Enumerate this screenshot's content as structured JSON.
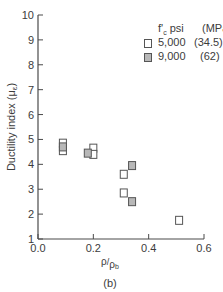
{
  "chart_data": {
    "type": "scatter",
    "title": "",
    "xlabel": "ρ/ρb",
    "ylabel": "Ductility index (με)",
    "caption": "(b)",
    "xlim": [
      0.0,
      0.6
    ],
    "ylim": [
      1,
      10
    ],
    "x_ticks": [
      "0.0",
      "0.2",
      "0.4",
      "0.6"
    ],
    "y_ticks": [
      "1",
      "2",
      "3",
      "4",
      "5",
      "6",
      "7",
      "8",
      "9",
      "10"
    ],
    "grid": false,
    "legend_position": "upper right",
    "legend_header": {
      "fc": "f'c psi",
      "mpa": "(MPa)"
    },
    "series": [
      {
        "name": "5,000 (34.5)",
        "psi": "5,000",
        "mpa": "(34.5)",
        "marker": "open-square",
        "fill": "#ffffff",
        "points": [
          [
            0.09,
            4.85
          ],
          [
            0.09,
            4.55
          ],
          [
            0.2,
            4.65
          ],
          [
            0.2,
            4.4
          ],
          [
            0.31,
            3.6
          ],
          [
            0.31,
            2.85
          ],
          [
            0.51,
            1.75
          ]
        ]
      },
      {
        "name": "9,000 (62)",
        "psi": "9,000",
        "mpa": "(62)",
        "marker": "gray-square",
        "fill": "#b8b8b8",
        "points": [
          [
            0.09,
            4.7
          ],
          [
            0.18,
            4.45
          ],
          [
            0.34,
            3.95
          ],
          [
            0.34,
            2.5
          ]
        ]
      }
    ]
  },
  "labels": {
    "xlabel_rho": "ρ",
    "xlabel_slash": "/",
    "xlabel_rhob": "ρ",
    "xlabel_sub": "b",
    "ylabel_text": "Ductility index (μ",
    "ylabel_sub": "ε",
    "ylabel_close": ")",
    "caption": "(b)",
    "legend_fc": "f'",
    "legend_fc_sub": "c",
    "legend_psi": " psi",
    "legend_mpa": "(MPa)",
    "legend_5000": "5,000",
    "legend_5000_mpa": "(34.5)",
    "legend_9000": "9,000",
    "legend_9000_mpa": "(62)"
  },
  "axis": {
    "x0px": 38,
    "x1px": 204,
    "y0px": 239,
    "y1px": 15,
    "color": "#4a4a4a"
  }
}
